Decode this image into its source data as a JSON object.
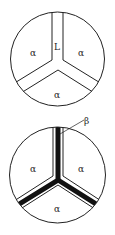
{
  "diagram": {
    "colors": {
      "line": "#222222",
      "beta_fill": "#111111",
      "background": "#ffffff"
    },
    "top": {
      "labels": {
        "left": "α",
        "right": "α",
        "bottom": "α",
        "channel": "L"
      }
    },
    "bottom": {
      "labels": {
        "left": "α",
        "right": "α",
        "bottom": "α",
        "callout": "β"
      }
    }
  }
}
